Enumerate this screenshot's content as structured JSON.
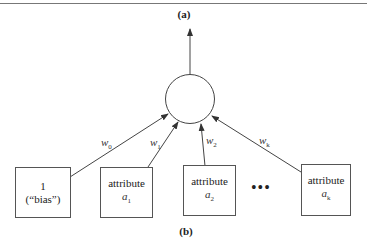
{
  "labels": {
    "panel_a": "(a)",
    "panel_b": "(b)",
    "ellipsis": "•••"
  },
  "nodes": {
    "output_unit": {
      "shape": "circle"
    },
    "inputs": [
      {
        "line1": "1",
        "line2": "(“bias”)",
        "sub_var": "",
        "sub_idx": ""
      },
      {
        "line1": "attribute",
        "line2": "",
        "sub_var": "a",
        "sub_idx": "1"
      },
      {
        "line1": "attribute",
        "line2": "",
        "sub_var": "a",
        "sub_idx": "2"
      },
      {
        "line1": "attribute",
        "line2": "",
        "sub_var": "a",
        "sub_idx": "k"
      }
    ]
  },
  "weights": [
    {
      "var": "w",
      "idx": "0"
    },
    {
      "var": "w",
      "idx": "1"
    },
    {
      "var": "w",
      "idx": "2"
    },
    {
      "var": "w",
      "idx": "k"
    }
  ],
  "colors": {
    "line": "#444444",
    "border": "#555555"
  }
}
